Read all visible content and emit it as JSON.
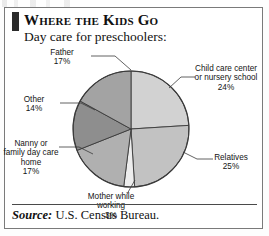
{
  "header": {
    "title": "Where the Kids Go",
    "subtitle": "Day care for preschoolers:"
  },
  "footer": {
    "source_label": "Source:",
    "source_value": "U.S. Census Bureau."
  },
  "labels": {
    "father": {
      "name": "Father",
      "pct": "17%"
    },
    "other": {
      "name": "Other",
      "pct": "14%"
    },
    "nanny_l1": "Nanny or",
    "nanny_l2": "family day care",
    "nanny_l3": "home",
    "nanny_pct": "17%",
    "mother_l1": "Mother while",
    "mother_l2": "working",
    "mother_pct": "3%",
    "center_l1": "Child care center",
    "center_l2": "or nursery school",
    "center_pct": "24%",
    "relatives_name": "Relatives",
    "relatives_pct": "25%"
  },
  "chart_data": {
    "type": "pie",
    "title": "Where the Kids Go",
    "subtitle": "Day care for preschoolers:",
    "unit": "percent",
    "start_angle_deg": 0,
    "direction": "clockwise",
    "total": 100,
    "categories": [
      "Child care center or nursery school",
      "Relatives",
      "Mother while working",
      "Nanny or family day care home",
      "Other",
      "Father"
    ],
    "values": [
      24,
      25,
      3,
      17,
      14,
      17
    ],
    "slices": [
      {
        "label": "Child care center or nursery school",
        "value": 24,
        "color": "#d2d2d2"
      },
      {
        "label": "Relatives",
        "value": 25,
        "color": "#c2c2c2"
      },
      {
        "label": "Mother while working",
        "value": 3,
        "color": "#ededed"
      },
      {
        "label": "Nanny or family day care home",
        "value": 17,
        "color": "#b0b0b0"
      },
      {
        "label": "Other",
        "value": 14,
        "color": "#8e8e8e"
      },
      {
        "label": "Father",
        "value": 17,
        "color": "#a3a3a3"
      }
    ],
    "legend": "none",
    "grid": false,
    "source": "U.S. Census Bureau."
  },
  "style": {
    "stroke": "#3a3a3a",
    "frame": "#7a7a7a",
    "text": "#141414"
  }
}
